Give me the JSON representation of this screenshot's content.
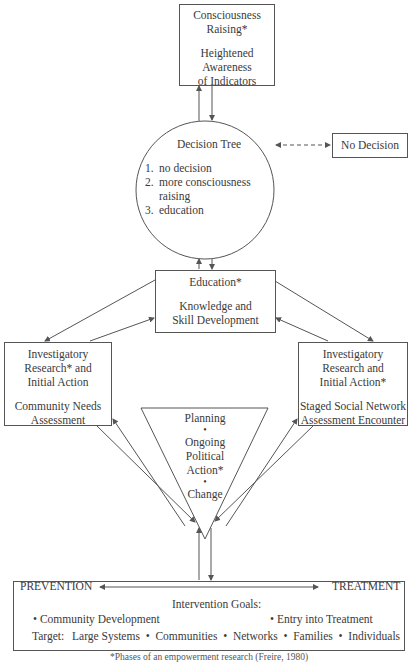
{
  "diagram": {
    "consciousness_box": {
      "title": "Consciousness",
      "title2": "Raising*",
      "line1": "Heightened",
      "line2": "Awareness",
      "line3": "of Indicators"
    },
    "decision_tree": {
      "title": "Decision Tree",
      "items": [
        {
          "num": "1.",
          "text": "no decision"
        },
        {
          "num": "2.",
          "text": "more consciousness"
        },
        {
          "num": "",
          "text": "raising"
        },
        {
          "num": "3.",
          "text": "education"
        }
      ]
    },
    "no_decision_box": {
      "label": "No Decision"
    },
    "education_box": {
      "title": "Education*",
      "line1": "Knowledge and",
      "line2": "Skill Development"
    },
    "left_box": {
      "line1": "Investigatory",
      "line2": "Research* and",
      "line3": "Initial Action",
      "line4": "Community Needs",
      "line5": "Assessment"
    },
    "right_box": {
      "line1": "Investigatory",
      "line2": "Research and",
      "line3": "Initial Action*",
      "line4": "Staged Social Network",
      "line5": "Assessment Encounter"
    },
    "triangle": {
      "line1": "Planning",
      "bullet": "•",
      "line2": "Ongoing",
      "line3": "Political",
      "line4": "Action*",
      "line5": "Change"
    },
    "bottom_box": {
      "left_label": "PREVENTION",
      "right_label": "TREATMENT",
      "goals_title": "Intervention Goals:",
      "goal_left": "• Community Development",
      "goal_right": "• Entry into Treatment",
      "target_label": "Target:",
      "targets": "Large Systems  •  Communities  •  Networks  •  Families  •  Individuals"
    },
    "footnote": "*Phases of an empowerment research (Freire, 1980)"
  },
  "colors": {
    "line": "#555555",
    "text": "#3a3a3a",
    "background": "#ffffff"
  }
}
